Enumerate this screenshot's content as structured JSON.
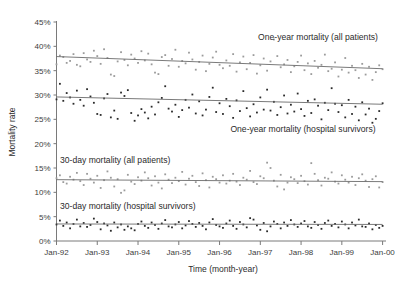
{
  "chart_data": {
    "type": "scatter",
    "title": "",
    "xlabel": "Time (month-year)",
    "ylabel": "Mortality rate",
    "grid": false,
    "legend_position": "inline-annotations",
    "xlim": [
      0,
      97
    ],
    "ylim": [
      0,
      45
    ],
    "x_tick_labels": [
      "Jan-92",
      "Jan-93",
      "Jan-94",
      "Jan-95",
      "Jan-96",
      "Jan-97",
      "Jan-98",
      "Jan-99",
      "Jan-00"
    ],
    "x_tick_values": [
      0,
      12,
      24,
      36,
      48,
      60,
      72,
      84,
      96
    ],
    "y_tick_labels": [
      "0%",
      "5%",
      "10%",
      "15%",
      "20%",
      "25%",
      "30%",
      "35%",
      "40%",
      "45%"
    ],
    "y_tick_values": [
      0,
      5,
      10,
      15,
      20,
      25,
      30,
      35,
      40,
      45
    ],
    "series": [
      {
        "name": "One-year mortality (all patients)",
        "marker": "light",
        "annotation": "One-year mortality (all patients)",
        "trend_start": 37.9,
        "trend_end": 35.4,
        "values": [
          36.3,
          38.1,
          37.8,
          36.6,
          37.0,
          38.4,
          36.2,
          35.9,
          38.6,
          37.3,
          36.8,
          39.1,
          38.0,
          36.4,
          39.4,
          37.6,
          34.2,
          33.9,
          36.9,
          38.8,
          37.2,
          36.1,
          38.3,
          37.5,
          36.6,
          39.0,
          37.1,
          38.5,
          36.3,
          34.6,
          34.3,
          37.8,
          38.2,
          36.0,
          37.4,
          39.3,
          35.8,
          37.0,
          36.5,
          38.7,
          37.3,
          35.2,
          36.8,
          38.1,
          34.9,
          36.4,
          37.7,
          38.9,
          36.2,
          35.5,
          37.1,
          36.0,
          38.4,
          34.8,
          36.7,
          37.9,
          35.3,
          36.6,
          38.2,
          34.4,
          36.1,
          37.5,
          35.0,
          36.9,
          41.4,
          38.0,
          35.7,
          36.3,
          37.2,
          34.7,
          35.9,
          36.8,
          38.1,
          35.1,
          36.5,
          34.3,
          37.0,
          35.6,
          36.2,
          38.3,
          34.9,
          35.4,
          36.7,
          33.8,
          35.2,
          37.6,
          34.6,
          36.0,
          35.1,
          33.5,
          36.4,
          34.2,
          35.8,
          33.1,
          34.7,
          36.1,
          35.3
        ]
      },
      {
        "name": "One-year mortality (hospital survivors)",
        "marker": "dark",
        "annotation": "One-year mortality (hospital survivors)",
        "trend_start": 29.6,
        "trend_end": 28.1,
        "values": [
          29.1,
          32.3,
          28.8,
          30.4,
          29.5,
          28.2,
          30.9,
          29.0,
          27.8,
          31.2,
          29.7,
          28.4,
          26.1,
          25.9,
          29.3,
          30.2,
          25.4,
          26.8,
          25.1,
          30.5,
          29.8,
          31.0,
          26.3,
          24.7,
          25.8,
          27.1,
          26.4,
          25.2,
          27.6,
          26.0,
          28.5,
          29.4,
          31.8,
          27.2,
          26.6,
          28.0,
          25.5,
          26.9,
          29.0,
          27.4,
          30.1,
          26.2,
          28.7,
          25.8,
          27.0,
          29.6,
          31.5,
          26.5,
          28.3,
          26.1,
          29.2,
          27.7,
          25.3,
          28.9,
          26.7,
          30.8,
          27.3,
          25.6,
          28.1,
          26.4,
          29.5,
          27.0,
          31.1,
          26.8,
          28.6,
          25.9,
          27.5,
          29.9,
          26.2,
          28.0,
          26.6,
          30.3,
          27.1,
          25.7,
          28.8,
          26.3,
          29.1,
          27.8,
          25.0,
          28.4,
          26.9,
          31.4,
          28.2,
          26.5,
          27.9,
          25.4,
          29.0,
          26.1,
          27.6,
          24.8,
          28.5,
          26.0,
          27.2,
          24.3,
          25.1,
          26.7,
          28.3
        ]
      },
      {
        "name": "30-day mortality (all patients)",
        "marker": "light",
        "annotation": "30-day mortality (all patients)",
        "trend_start": 12.6,
        "trend_end": 12.2,
        "values": [
          12.9,
          13.5,
          12.1,
          11.8,
          13.2,
          12.6,
          14.0,
          12.3,
          11.5,
          13.8,
          12.8,
          12.0,
          13.4,
          10.9,
          12.5,
          14.3,
          13.0,
          11.2,
          12.7,
          9.9,
          10.4,
          13.6,
          12.2,
          11.7,
          13.1,
          12.4,
          14.1,
          12.9,
          11.4,
          13.3,
          12.0,
          10.8,
          13.7,
          12.6,
          11.9,
          13.0,
          12.3,
          14.2,
          11.6,
          12.8,
          13.4,
          12.1,
          11.3,
          13.9,
          12.5,
          11.0,
          13.2,
          12.7,
          12.0,
          13.5,
          11.8,
          12.4,
          13.8,
          12.2,
          11.5,
          13.0,
          12.6,
          14.4,
          12.1,
          11.7,
          13.3,
          12.9,
          16.1,
          15.0,
          12.4,
          11.2,
          13.6,
          10.6,
          12.0,
          13.1,
          12.7,
          11.9,
          13.4,
          12.3,
          11.6,
          16.0,
          13.8,
          12.5,
          11.4,
          13.0,
          12.8,
          14.1,
          12.2,
          11.8,
          13.5,
          12.6,
          12.0,
          13.2,
          11.5,
          12.9,
          13.7,
          12.4,
          11.1,
          12.7,
          13.3,
          11.0,
          12.1
        ]
      },
      {
        "name": "30-day mortality (hospital survivors)",
        "marker": "dark",
        "annotation": "30-day mortality (hospital survivors)",
        "trend_start": 3.5,
        "trend_end": 3.4,
        "values": [
          3.4,
          4.2,
          3.1,
          3.8,
          2.6,
          3.5,
          4.4,
          3.0,
          3.7,
          2.9,
          3.3,
          4.6,
          3.9,
          2.4,
          3.6,
          3.2,
          2.1,
          3.8,
          2.8,
          3.4,
          2.3,
          3.0,
          2.6,
          2.2,
          3.5,
          4.0,
          3.1,
          2.7,
          3.8,
          3.3,
          2.5,
          3.6,
          4.3,
          3.0,
          2.8,
          3.4,
          3.9,
          2.6,
          3.2,
          4.1,
          3.5,
          2.9,
          3.7,
          3.1,
          2.4,
          3.8,
          4.5,
          3.3,
          3.0,
          2.7,
          3.6,
          4.2,
          3.1,
          2.5,
          3.9,
          3.4,
          2.8,
          4.7,
          4.4,
          3.2,
          2.3,
          3.7,
          2.0,
          3.0,
          4.0,
          3.5,
          2.6,
          3.8,
          3.1,
          4.3,
          3.4,
          2.9,
          3.6,
          4.1,
          3.0,
          2.7,
          3.9,
          3.3,
          2.5,
          3.7,
          4.2,
          3.1,
          3.5,
          2.8,
          4.0,
          3.4,
          2.6,
          3.8,
          3.2,
          4.4,
          3.0,
          2.9,
          3.6,
          2.4,
          3.3,
          2.7,
          3.1
        ]
      }
    ]
  }
}
